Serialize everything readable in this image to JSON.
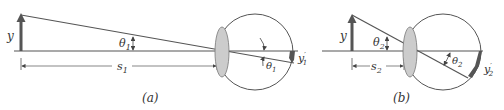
{
  "colors": {
    "line": "#555555",
    "object_arrow": "#555555",
    "lens_fill": "#cccccc",
    "background": "#ffffff"
  },
  "panel_a": {
    "caption": "(a)",
    "object_label": "y",
    "angle_label": "θ",
    "angle_sub": "1",
    "distance_label": "s",
    "distance_sub": "1",
    "inner_angle_label": "θ",
    "inner_angle_sub": "1",
    "image_label": "y",
    "image_sub": "1",
    "image_prime": "′"
  },
  "panel_b": {
    "caption": "(b)",
    "object_label": "y",
    "angle_label": "θ",
    "angle_sub": "2",
    "distance_label": "s",
    "distance_sub": "2",
    "inner_angle_label": "θ",
    "inner_angle_sub": "2",
    "image_label": "y",
    "image_sub": "2",
    "image_prime": "′"
  }
}
